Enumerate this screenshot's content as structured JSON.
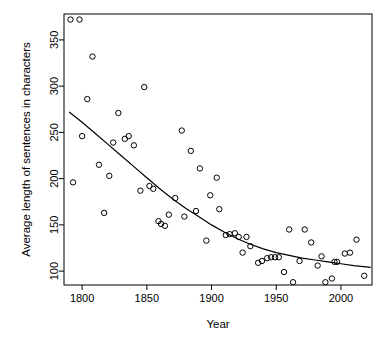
{
  "chart_data": {
    "type": "scatter",
    "title": "",
    "xlabel": "Year",
    "ylabel": "Average length of sentences in characters",
    "xlim": [
      1786,
      2024
    ],
    "ylim": [
      85,
      378
    ],
    "xticks": [
      1800,
      1850,
      1900,
      1950,
      2000
    ],
    "xtick_labels": [
      "1800",
      "1850",
      "1900",
      "1950",
      "2000"
    ],
    "yticks": [
      100,
      150,
      200,
      250,
      300,
      350
    ],
    "ytick_labels": [
      "100",
      "150",
      "200",
      "250",
      "300",
      "350"
    ],
    "grid": false,
    "legend": null,
    "marker": "open-circle",
    "point_color": "#000000",
    "curve_color": "#000000",
    "points": [
      {
        "x": 1791,
        "y": 372
      },
      {
        "x": 1798,
        "y": 372
      },
      {
        "x": 1793,
        "y": 196
      },
      {
        "x": 1800,
        "y": 246
      },
      {
        "x": 1804,
        "y": 286
      },
      {
        "x": 1808,
        "y": 332
      },
      {
        "x": 1813,
        "y": 215
      },
      {
        "x": 1817,
        "y": 163
      },
      {
        "x": 1821,
        "y": 203
      },
      {
        "x": 1824,
        "y": 239
      },
      {
        "x": 1828,
        "y": 271
      },
      {
        "x": 1833,
        "y": 243
      },
      {
        "x": 1836,
        "y": 246
      },
      {
        "x": 1840,
        "y": 236
      },
      {
        "x": 1845,
        "y": 187
      },
      {
        "x": 1848,
        "y": 299
      },
      {
        "x": 1852,
        "y": 192
      },
      {
        "x": 1855,
        "y": 189
      },
      {
        "x": 1859,
        "y": 154
      },
      {
        "x": 1861,
        "y": 151
      },
      {
        "x": 1864,
        "y": 149
      },
      {
        "x": 1867,
        "y": 161
      },
      {
        "x": 1872,
        "y": 179
      },
      {
        "x": 1877,
        "y": 252
      },
      {
        "x": 1879,
        "y": 159
      },
      {
        "x": 1884,
        "y": 230
      },
      {
        "x": 1888,
        "y": 165
      },
      {
        "x": 1891,
        "y": 211
      },
      {
        "x": 1896,
        "y": 133
      },
      {
        "x": 1899,
        "y": 182
      },
      {
        "x": 1904,
        "y": 201
      },
      {
        "x": 1906,
        "y": 167
      },
      {
        "x": 1911,
        "y": 139
      },
      {
        "x": 1914,
        "y": 140
      },
      {
        "x": 1918,
        "y": 141
      },
      {
        "x": 1921,
        "y": 137
      },
      {
        "x": 1924,
        "y": 120
      },
      {
        "x": 1927,
        "y": 137
      },
      {
        "x": 1930,
        "y": 127
      },
      {
        "x": 1936,
        "y": 109
      },
      {
        "x": 1939,
        "y": 111
      },
      {
        "x": 1943,
        "y": 114
      },
      {
        "x": 1946,
        "y": 115
      },
      {
        "x": 1949,
        "y": 115
      },
      {
        "x": 1952,
        "y": 115
      },
      {
        "x": 1956,
        "y": 99
      },
      {
        "x": 1960,
        "y": 145
      },
      {
        "x": 1963,
        "y": 88
      },
      {
        "x": 1968,
        "y": 111
      },
      {
        "x": 1972,
        "y": 145
      },
      {
        "x": 1977,
        "y": 131
      },
      {
        "x": 1982,
        "y": 106
      },
      {
        "x": 1985,
        "y": 116
      },
      {
        "x": 1988,
        "y": 88
      },
      {
        "x": 1993,
        "y": 92
      },
      {
        "x": 1995,
        "y": 110
      },
      {
        "x": 1997,
        "y": 110
      },
      {
        "x": 2003,
        "y": 119
      },
      {
        "x": 2007,
        "y": 120
      },
      {
        "x": 2012,
        "y": 134
      },
      {
        "x": 2018,
        "y": 95
      }
    ],
    "fit_curve": {
      "name": "smoothed-trend",
      "points": [
        {
          "x": 1790,
          "y": 272
        },
        {
          "x": 1800,
          "y": 261
        },
        {
          "x": 1810,
          "y": 249
        },
        {
          "x": 1820,
          "y": 237
        },
        {
          "x": 1830,
          "y": 225
        },
        {
          "x": 1840,
          "y": 213
        },
        {
          "x": 1850,
          "y": 201
        },
        {
          "x": 1860,
          "y": 189
        },
        {
          "x": 1870,
          "y": 178
        },
        {
          "x": 1880,
          "y": 168
        },
        {
          "x": 1890,
          "y": 159
        },
        {
          "x": 1900,
          "y": 150
        },
        {
          "x": 1910,
          "y": 142
        },
        {
          "x": 1920,
          "y": 135
        },
        {
          "x": 1930,
          "y": 129
        },
        {
          "x": 1940,
          "y": 124
        },
        {
          "x": 1950,
          "y": 120
        },
        {
          "x": 1960,
          "y": 117
        },
        {
          "x": 1970,
          "y": 114
        },
        {
          "x": 1980,
          "y": 112
        },
        {
          "x": 1990,
          "y": 110
        },
        {
          "x": 2000,
          "y": 108
        },
        {
          "x": 2010,
          "y": 106
        },
        {
          "x": 2023,
          "y": 104
        }
      ]
    }
  }
}
